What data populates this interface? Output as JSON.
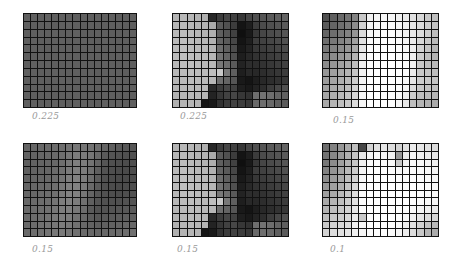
{
  "chart_data": [
    {
      "type": "heatmap",
      "title": "",
      "label": "0.225",
      "rows": 12,
      "cols": 16,
      "colormap": "grayscale (0=black, 255=white)",
      "values": [
        [
          95,
          96,
          94,
          97,
          95,
          96,
          95,
          94,
          96,
          95,
          97,
          95,
          96,
          94,
          95,
          96
        ],
        [
          96,
          94,
          95,
          96,
          94,
          95,
          97,
          95,
          94,
          96,
          95,
          94,
          95,
          96,
          94,
          95
        ],
        [
          94,
          95,
          96,
          95,
          96,
          94,
          95,
          96,
          95,
          94,
          96,
          95,
          94,
          95,
          96,
          95
        ],
        [
          95,
          96,
          94,
          95,
          95,
          96,
          94,
          95,
          96,
          95,
          94,
          96,
          95,
          94,
          95,
          94
        ],
        [
          96,
          95,
          95,
          94,
          96,
          95,
          96,
          94,
          95,
          96,
          95,
          94,
          96,
          95,
          94,
          96
        ],
        [
          94,
          94,
          96,
          95,
          94,
          96,
          95,
          95,
          94,
          95,
          96,
          95,
          94,
          96,
          95,
          95
        ],
        [
          95,
          96,
          95,
          96,
          95,
          94,
          96,
          95,
          96,
          94,
          95,
          96,
          95,
          94,
          96,
          94
        ],
        [
          96,
          95,
          94,
          95,
          96,
          95,
          94,
          96,
          95,
          96,
          94,
          95,
          96,
          95,
          94,
          95
        ],
        [
          94,
          96,
          95,
          94,
          95,
          96,
          95,
          94,
          96,
          95,
          95,
          94,
          95,
          96,
          95,
          96
        ],
        [
          95,
          94,
          96,
          95,
          94,
          95,
          96,
          95,
          94,
          96,
          95,
          96,
          94,
          95,
          96,
          95
        ],
        [
          96,
          95,
          95,
          96,
          95,
          94,
          95,
          96,
          95,
          94,
          96,
          95,
          95,
          94,
          95,
          94
        ],
        [
          95,
          96,
          94,
          95,
          96,
          95,
          94,
          95,
          96,
          95,
          94,
          96,
          95,
          96,
          94,
          95
        ]
      ]
    },
    {
      "type": "heatmap",
      "title": "",
      "label": "0.225",
      "rows": 12,
      "cols": 16,
      "colormap": "grayscale (0=black, 255=white)",
      "values": [
        [
          180,
          185,
          182,
          178,
          175,
          40,
          60,
          70,
          65,
          55,
          70,
          80,
          85,
          90,
          95,
          100
        ],
        [
          182,
          186,
          184,
          180,
          178,
          170,
          90,
          80,
          60,
          20,
          30,
          60,
          75,
          80,
          85,
          90
        ],
        [
          184,
          188,
          186,
          182,
          180,
          175,
          95,
          85,
          65,
          15,
          25,
          55,
          70,
          75,
          80,
          85
        ],
        [
          185,
          190,
          188,
          184,
          182,
          178,
          100,
          90,
          70,
          20,
          30,
          60,
          65,
          70,
          75,
          80
        ],
        [
          186,
          190,
          188,
          186,
          184,
          180,
          110,
          95,
          75,
          25,
          35,
          55,
          60,
          65,
          70,
          75
        ],
        [
          186,
          190,
          190,
          188,
          186,
          182,
          115,
          100,
          80,
          30,
          40,
          50,
          55,
          60,
          65,
          70
        ],
        [
          185,
          190,
          190,
          188,
          186,
          184,
          120,
          110,
          90,
          35,
          45,
          45,
          50,
          55,
          60,
          65
        ],
        [
          184,
          188,
          190,
          188,
          186,
          190,
          200,
          120,
          95,
          30,
          40,
          40,
          45,
          50,
          55,
          60
        ],
        [
          182,
          186,
          188,
          186,
          184,
          182,
          110,
          100,
          85,
          25,
          20,
          30,
          40,
          45,
          50,
          55
        ],
        [
          180,
          184,
          186,
          184,
          182,
          40,
          60,
          70,
          65,
          30,
          25,
          35,
          45,
          60,
          70,
          80
        ],
        [
          178,
          182,
          184,
          182,
          180,
          35,
          55,
          65,
          70,
          55,
          50,
          110,
          115,
          110,
          100,
          95
        ],
        [
          176,
          180,
          182,
          180,
          20,
          25,
          50,
          60,
          65,
          60,
          55,
          105,
          110,
          105,
          95,
          90
        ]
      ]
    },
    {
      "type": "heatmap",
      "title": "",
      "label": "0.15",
      "rows": 12,
      "cols": 16,
      "colormap": "grayscale (0=black, 255=white)",
      "values": [
        [
          80,
          95,
          105,
          115,
          130,
          200,
          240,
          245,
          248,
          245,
          240,
          235,
          225,
          215,
          200,
          190
        ],
        [
          90,
          100,
          110,
          120,
          140,
          210,
          245,
          250,
          252,
          250,
          245,
          240,
          230,
          220,
          205,
          195
        ],
        [
          100,
          110,
          120,
          130,
          150,
          220,
          248,
          252,
          254,
          252,
          248,
          242,
          232,
          220,
          205,
          190
        ],
        [
          110,
          120,
          130,
          140,
          160,
          225,
          250,
          253,
          255,
          253,
          250,
          244,
          235,
          215,
          200,
          185
        ],
        [
          120,
          130,
          140,
          150,
          170,
          230,
          252,
          254,
          255,
          254,
          252,
          246,
          238,
          210,
          195,
          180
        ],
        [
          130,
          140,
          150,
          160,
          180,
          235,
          252,
          255,
          255,
          255,
          252,
          248,
          240,
          205,
          190,
          180
        ],
        [
          140,
          150,
          160,
          170,
          190,
          240,
          253,
          255,
          255,
          255,
          253,
          250,
          240,
          200,
          190,
          185
        ],
        [
          150,
          160,
          170,
          180,
          200,
          242,
          253,
          255,
          255,
          255,
          253,
          250,
          235,
          200,
          195,
          190
        ],
        [
          155,
          165,
          175,
          185,
          205,
          244,
          254,
          255,
          255,
          255,
          253,
          248,
          230,
          205,
          200,
          195
        ],
        [
          160,
          170,
          180,
          190,
          210,
          245,
          254,
          255,
          255,
          254,
          252,
          245,
          220,
          200,
          195,
          190
        ],
        [
          165,
          175,
          185,
          195,
          215,
          246,
          254,
          255,
          255,
          254,
          250,
          240,
          205,
          190,
          185,
          180
        ],
        [
          170,
          180,
          190,
          200,
          220,
          246,
          254,
          254,
          254,
          252,
          245,
          230,
          190,
          180,
          175,
          170
        ]
      ]
    },
    {
      "type": "heatmap",
      "title": "",
      "label": "0.15",
      "rows": 12,
      "cols": 16,
      "colormap": "grayscale (0=black, 255=white)",
      "values": [
        [
          100,
          102,
          104,
          106,
          108,
          110,
          115,
          120,
          118,
          115,
          110,
          100,
          95,
          90,
          88,
          86
        ],
        [
          98,
          100,
          102,
          104,
          106,
          110,
          118,
          124,
          122,
          118,
          105,
          90,
          85,
          82,
          80,
          80
        ],
        [
          96,
          98,
          100,
          102,
          104,
          110,
          120,
          126,
          124,
          115,
          100,
          85,
          80,
          78,
          76,
          78
        ],
        [
          96,
          98,
          100,
          102,
          106,
          112,
          122,
          128,
          124,
          112,
          95,
          82,
          78,
          75,
          74,
          76
        ],
        [
          98,
          100,
          102,
          104,
          108,
          116,
          126,
          130,
          124,
          110,
          92,
          80,
          76,
          74,
          74,
          76
        ],
        [
          100,
          102,
          104,
          106,
          110,
          120,
          128,
          130,
          122,
          105,
          90,
          80,
          76,
          74,
          76,
          78
        ],
        [
          102,
          104,
          106,
          108,
          112,
          122,
          130,
          128,
          118,
          100,
          86,
          80,
          78,
          76,
          78,
          80
        ],
        [
          104,
          106,
          108,
          110,
          116,
          126,
          130,
          124,
          112,
          95,
          84,
          80,
          80,
          80,
          82,
          84
        ],
        [
          106,
          108,
          110,
          112,
          118,
          126,
          128,
          120,
          108,
          90,
          82,
          82,
          84,
          86,
          88,
          90
        ],
        [
          106,
          108,
          110,
          114,
          120,
          126,
          124,
          114,
          104,
          92,
          86,
          88,
          90,
          92,
          94,
          96
        ],
        [
          106,
          108,
          112,
          116,
          120,
          124,
          120,
          112,
          104,
          98,
          94,
          96,
          98,
          100,
          102,
          104
        ],
        [
          106,
          110,
          112,
          116,
          120,
          122,
          118,
          112,
          106,
          104,
          102,
          104,
          106,
          108,
          110,
          112
        ]
      ]
    },
    {
      "type": "heatmap",
      "title": "",
      "label": "0.15",
      "rows": 12,
      "cols": 16,
      "colormap": "grayscale (0=black, 255=white)",
      "values": [
        [
          180,
          185,
          182,
          178,
          175,
          40,
          60,
          70,
          65,
          55,
          70,
          80,
          85,
          90,
          95,
          100
        ],
        [
          182,
          186,
          184,
          180,
          178,
          170,
          90,
          80,
          60,
          20,
          30,
          60,
          75,
          80,
          85,
          90
        ],
        [
          184,
          188,
          186,
          182,
          180,
          175,
          95,
          85,
          65,
          15,
          25,
          55,
          70,
          75,
          80,
          85
        ],
        [
          185,
          190,
          188,
          184,
          182,
          178,
          100,
          90,
          70,
          20,
          30,
          60,
          65,
          70,
          75,
          80
        ],
        [
          186,
          190,
          188,
          186,
          184,
          180,
          110,
          95,
          75,
          25,
          35,
          55,
          60,
          65,
          70,
          75
        ],
        [
          186,
          190,
          190,
          188,
          186,
          182,
          115,
          100,
          80,
          30,
          40,
          50,
          55,
          60,
          65,
          70
        ],
        [
          185,
          190,
          190,
          188,
          186,
          184,
          120,
          110,
          90,
          35,
          45,
          45,
          50,
          55,
          60,
          65
        ],
        [
          184,
          188,
          190,
          188,
          186,
          190,
          200,
          120,
          95,
          30,
          40,
          40,
          45,
          50,
          55,
          60
        ],
        [
          182,
          186,
          188,
          186,
          184,
          182,
          110,
          100,
          85,
          25,
          20,
          30,
          40,
          45,
          50,
          55
        ],
        [
          180,
          184,
          186,
          184,
          182,
          40,
          60,
          70,
          65,
          30,
          25,
          35,
          45,
          60,
          70,
          80
        ],
        [
          178,
          182,
          184,
          182,
          180,
          35,
          55,
          65,
          70,
          55,
          50,
          110,
          115,
          110,
          100,
          95
        ],
        [
          176,
          180,
          182,
          180,
          20,
          25,
          50,
          60,
          65,
          60,
          55,
          105,
          110,
          105,
          95,
          90
        ]
      ]
    },
    {
      "type": "heatmap",
      "title": "",
      "label": "0.1",
      "rows": 12,
      "cols": 16,
      "colormap": "grayscale (0=black, 255=white)",
      "values": [
        [
          110,
          130,
          150,
          170,
          190,
          70,
          210,
          225,
          230,
          220,
          210,
          225,
          235,
          230,
          225,
          220
        ],
        [
          115,
          135,
          155,
          175,
          195,
          230,
          245,
          250,
          245,
          240,
          150,
          235,
          245,
          240,
          235,
          230
        ],
        [
          120,
          140,
          160,
          180,
          200,
          240,
          252,
          254,
          250,
          248,
          200,
          242,
          250,
          248,
          244,
          240
        ],
        [
          130,
          148,
          165,
          185,
          205,
          245,
          254,
          255,
          254,
          252,
          248,
          250,
          252,
          250,
          248,
          245
        ],
        [
          140,
          155,
          170,
          190,
          210,
          248,
          255,
          255,
          255,
          254,
          252,
          252,
          254,
          252,
          250,
          248
        ],
        [
          150,
          160,
          175,
          195,
          215,
          250,
          255,
          255,
          255,
          255,
          254,
          254,
          255,
          254,
          252,
          250
        ],
        [
          160,
          170,
          185,
          200,
          220,
          250,
          255,
          255,
          255,
          255,
          255,
          255,
          255,
          254,
          252,
          250
        ],
        [
          170,
          180,
          190,
          205,
          225,
          252,
          255,
          255,
          255,
          255,
          255,
          255,
          254,
          252,
          250,
          248
        ],
        [
          180,
          190,
          200,
          210,
          230,
          252,
          255,
          255,
          255,
          255,
          255,
          254,
          250,
          245,
          240,
          235
        ],
        [
          190,
          200,
          205,
          215,
          235,
          200,
          252,
          255,
          255,
          255,
          254,
          250,
          240,
          230,
          220,
          215
        ],
        [
          200,
          210,
          215,
          220,
          240,
          248,
          254,
          255,
          255,
          254,
          250,
          240,
          225,
          210,
          195,
          185
        ],
        [
          210,
          220,
          225,
          230,
          240,
          245,
          250,
          252,
          252,
          250,
          245,
          235,
          220,
          200,
          180,
          170
        ]
      ]
    }
  ],
  "panels": [
    {
      "label": "0.225"
    },
    {
      "label": "0.225"
    },
    {
      "label": "0.15"
    },
    {
      "label": "0.15"
    },
    {
      "label": "0.15"
    },
    {
      "label": "0.1"
    }
  ]
}
